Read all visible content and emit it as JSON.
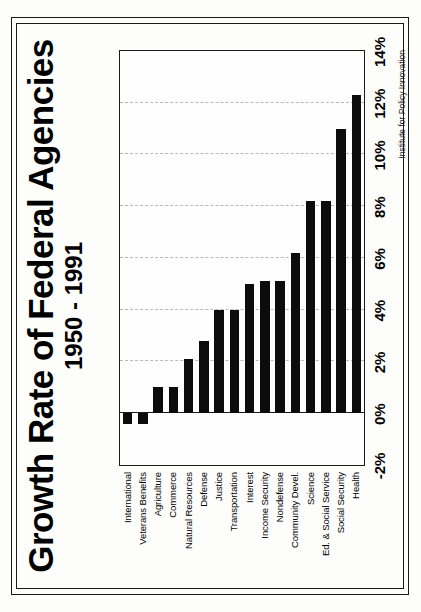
{
  "chart_data": {
    "type": "bar",
    "orientation": "horizontal",
    "title": "Growth Rate of Federal Agencies",
    "subtitle": "1950 - 1991",
    "xlabel": "",
    "ylabel": "",
    "grid": true,
    "legend": null,
    "attribution": "Institute for Policy Innovation",
    "value_axis": {
      "min": -2,
      "max": 14,
      "unit": "%",
      "ticks": [
        -2,
        0,
        2,
        4,
        6,
        8,
        10,
        12,
        14
      ],
      "tick_labels": [
        "-2%",
        "0%",
        "2%",
        "4%",
        "6%",
        "8%",
        "10%",
        "12%",
        "14%"
      ]
    },
    "categories": [
      "International",
      "Veterans Benefits",
      "Agriculture",
      "Commerce",
      "Natural Resources",
      "Defense",
      "Justice",
      "Transportation",
      "Interest",
      "Income Security",
      "Nondefense",
      "Community Devel.",
      "Science",
      "Ed. & Social Service",
      "Social Security",
      "Health"
    ],
    "values": [
      -0.4,
      -0.4,
      1.0,
      1.0,
      2.1,
      2.8,
      4.0,
      4.0,
      5.0,
      5.1,
      5.1,
      6.2,
      8.2,
      8.2,
      11.0,
      12.3
    ],
    "series": [
      {
        "name": "Annual growth rate 1950-1991",
        "values": [
          -0.4,
          -0.4,
          1.0,
          1.0,
          2.1,
          2.8,
          4.0,
          4.0,
          5.0,
          5.1,
          5.1,
          6.2,
          8.2,
          8.2,
          11.0,
          12.3
        ]
      }
    ],
    "bar_color": "#0c0c0c",
    "gridline_color": "#b9b9b9"
  }
}
